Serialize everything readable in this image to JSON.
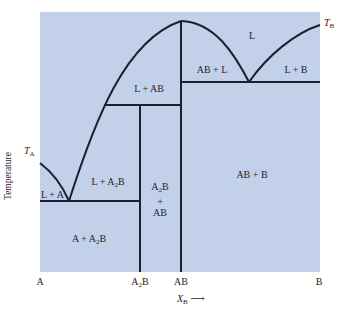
{
  "diagram": {
    "type": "binary phase diagram with congruently melting compound AB and incongruently melting compound A2B",
    "background_color": "#c2d0ea",
    "line_color": "#1a2030",
    "axes": {
      "y_label": "Temperature",
      "x_label_var": "X",
      "x_label_sub": "B",
      "x_arrow": "⟶",
      "x_ticks": [
        {
          "label": "A",
          "sub": ""
        },
        {
          "label": "A",
          "sub": "2",
          "suffix": "B"
        },
        {
          "label": "AB",
          "sub": ""
        },
        {
          "label": "B",
          "sub": ""
        }
      ]
    },
    "markers": {
      "T_A": {
        "main": "T",
        "sub": "A"
      },
      "T_B": {
        "main": "T",
        "sub": "B"
      }
    },
    "regions": {
      "L": "L",
      "L_plus_AB": "L + AB",
      "AB_plus_L": "AB + L",
      "L_plus_B": "L + B",
      "L_plus_A": "L + A",
      "L_plus_A2B": {
        "pre": "L + A",
        "sub": "2",
        "post": "B"
      },
      "A2B_plus_AB": {
        "line1_pre": "A",
        "line1_sub": "2",
        "line1_post": "B",
        "line2": "+",
        "line3": "AB"
      },
      "A_plus_A2B": {
        "pre": "A + A",
        "sub": "2",
        "post": "B"
      },
      "AB_plus_B": "AB + B"
    }
  }
}
